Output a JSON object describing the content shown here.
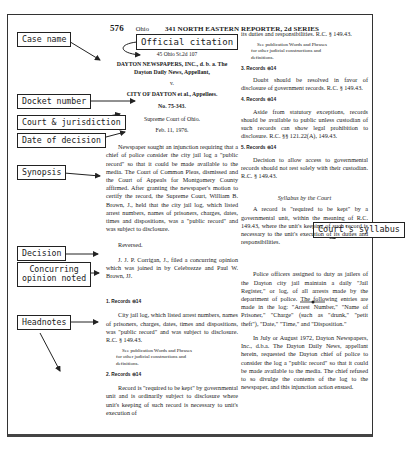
{
  "header": {
    "page_number": "576",
    "state": "Ohio",
    "reporter": "341 NORTH EASTERN REPORTER, 2d SERIES"
  },
  "labels": {
    "case_name": "Case name",
    "official_citation": "Official citation",
    "docket_number": "Docket number",
    "court_jurisdiction": "Court & jurisdiction",
    "date_of_decision": "Date of decision",
    "synopsis": "Synopsis",
    "decision": "Decision",
    "concurring_line1": "Concurring",
    "concurring_line2": "opinion noted",
    "headnotes": "Headnotes",
    "courts_syllabus": "Court's syllabus"
  },
  "case": {
    "citation": "45 Ohio St.2d 107",
    "appellant_line1": "DAYTON NEWSPAPERS, INC., d. b. a. The",
    "appellant_line2": "Dayton Daily News, Appellant,",
    "versus": "v.",
    "appellee": "CITY OF DAYTON et al., Appellees.",
    "docket": "No. 75-343.",
    "court": "Supreme Court of Ohio.",
    "date": "Feb. 11, 1976.",
    "synopsis": "Newspaper sought an injunction requiring that a chief of police consider the city jail log a \"public record\" so that it could be made available to the media. The Court of Common Pleas, dismissed and the Court of Appeals for Montgomery County affirmed. After granting the newspaper's motion to certify the record, the Supreme Court, William B. Brown, J., held that the city jail log, which listed arrest numbers, names of prisoners, charges, dates, times and dispositions, was a \"public record\" and was subject to disclosure.",
    "decision": "Reversed.",
    "concurring": "J. J. P. Corrigan, J., filed a concurring opinion which was joined in by Celebrezze and Paul W. Brown, JJ."
  },
  "headnotes": [
    {
      "key": "1. Records ⊜14",
      "text": "City jail log, which listed arrest numbers, names of prisoners, charges, dates, times and dispositions, was \"public record\" and was subject to disclosure. R.C. § 149.43.",
      "pub": [
        "See publication Words and Phrases",
        "for other judicial constructions and",
        "definitions."
      ]
    },
    {
      "key": "2. Records ⊜14",
      "text": "Record is \"required to be kept\" by governmental unit and is ordinarily subject to disclosure where unit's keeping of such record is necessary to unit's execution of"
    },
    {
      "cont": "its duties and responsibilities. R.C. § 149.43.",
      "pub": [
        "See publication Words and Phrases",
        "for other judicial constructions and",
        "definitions."
      ]
    },
    {
      "key": "3. Records ⊜14",
      "text": "Doubt should be resolved in favor of disclosure of government records. R.C. § 149.43."
    },
    {
      "key": "4. Records ⊜14",
      "text": "Aside from statutory exceptions, records should be available to public unless custodian of such records can show legal prohibition to disclosure. R.C. §§ 121.22(A), 149.43."
    },
    {
      "key": "5. Records ⊜14",
      "text": "Decision to allow access to governmental records should not rest solely with their custodian. R.C. § 149.43."
    }
  ],
  "syllabus": {
    "title": "Syllabus by the Court",
    "text": "A record is \"required to be kept\" by a governmental unit, within the meaning of R.C. 149.43, where the unit's keeping of such record is necessary to the unit's execution of its duties and responsibilities."
  },
  "opinion": {
    "para1": "Police officers assigned to duty as jailers of the Dayton city jail maintain a daily \"Jail Register,\" or log, of all arrests made by the department of police. The following entries are made in the log: \"Arrest Number,\" \"Name of Prisoner,\" \"Charge\" (such as \"drunk,\" \"petit theft\"), \"Date,\" \"Time,\" and \"Disposition.\"",
    "para2": "In July or August 1972, Dayton Newspapers, Inc., d.b.a. The Dayton Daily News, appellant herein, requested the Dayton chief of police to consider the log a \"public record\" so that it could be made available to the media. The chief refused to so divulge the contents of the log to the newspaper, and this injunction action ensued."
  }
}
